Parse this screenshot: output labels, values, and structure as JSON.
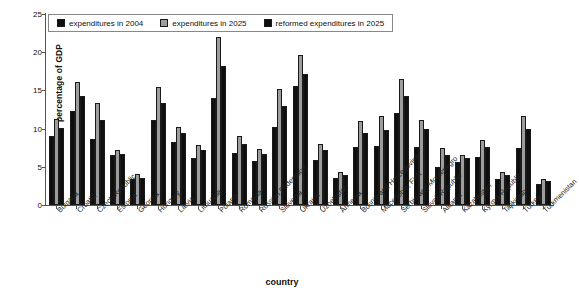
{
  "chart_data": {
    "type": "bar",
    "title": "",
    "xlabel": "country",
    "ylabel": "percentage of GDP",
    "ylim": [
      0,
      25
    ],
    "yticks": [
      0,
      5,
      10,
      15,
      20,
      25
    ],
    "grid": false,
    "legend_position": "top-left-inside",
    "categories": [
      "Bulgaria",
      "Croatia",
      "Czech Republic",
      "Estonia",
      "Georgia",
      "Hungary",
      "Latvia",
      "Lithuania",
      "Poland",
      "Romania",
      "Russian Federation",
      "Slovenia",
      "Ukraine",
      "Uzbekistan",
      "Armenia",
      "Bosnia and Herzegovina",
      "Macedonia, FYR",
      "Serbia and Montenegro",
      "Slovak Republic",
      "Albania",
      "Kazakhstan",
      "Kyrgyz Republic",
      "Tajikistan",
      "Turkey",
      "Turkmenistan"
    ],
    "series": [
      {
        "name": "expenditures in 2004",
        "color": "#0f0f0f",
        "values": [
          9.0,
          12.3,
          8.7,
          6.5,
          3.4,
          11.1,
          8.3,
          6.2,
          14.0,
          6.8,
          5.8,
          10.2,
          15.6,
          5.9,
          3.5,
          7.6,
          7.7,
          12.1,
          7.6,
          5.0,
          5.6,
          6.3,
          3.4,
          7.4,
          2.7
        ]
      },
      {
        "name": "expenditures in 2025",
        "color": "#9d9d9d",
        "values": [
          11.2,
          16.1,
          13.4,
          7.2,
          4.0,
          15.5,
          10.2,
          7.9,
          22.0,
          9.0,
          7.3,
          15.2,
          19.6,
          8.0,
          4.3,
          11.0,
          11.7,
          16.5,
          11.1,
          7.5,
          6.6,
          8.5,
          4.3,
          11.7,
          3.4
        ]
      },
      {
        "name": "reformed expenditures in 2025",
        "color": "#0f0f0f",
        "values": [
          10.1,
          14.3,
          11.1,
          6.7,
          3.6,
          13.4,
          9.4,
          7.2,
          18.2,
          8.0,
          6.7,
          12.9,
          17.2,
          7.2,
          3.9,
          9.4,
          9.8,
          14.3,
          9.9,
          6.5,
          6.2,
          7.6,
          3.9,
          10.0,
          3.1
        ]
      }
    ]
  }
}
